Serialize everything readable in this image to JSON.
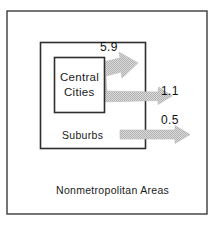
{
  "diagram": {
    "type": "migration-flow-schematic",
    "title_visible": false,
    "regions": [
      {
        "id": "central-cities",
        "label_line1": "Central",
        "label_line2": "Cities",
        "nesting_level": 2
      },
      {
        "id": "suburbs",
        "label": "Suburbs",
        "nesting_level": 1
      },
      {
        "id": "nonmetropolitan-areas",
        "label": "Nonmetropolitan Areas",
        "nesting_level": 0
      }
    ],
    "flows": [
      {
        "id": "flow-central-to-suburbs",
        "value": "5.9",
        "from": "Central Cities",
        "to": "Suburbs",
        "direction": "up-right"
      },
      {
        "id": "flow-central-to-nonmetro",
        "value": "1.1",
        "from": "Central Cities",
        "to": "Nonmetropolitan Areas",
        "direction": "right"
      },
      {
        "id": "flow-suburbs-to-nonmetro",
        "value": "0.5",
        "from": "Suburbs",
        "to": "Nonmetropolitan Areas",
        "direction": "right"
      }
    ],
    "colors": {
      "frame_stroke": "#3b3b3b",
      "box_stroke": "#2e2e2e",
      "arrow_fill": "#c9c9c9",
      "arrow_stroke": "#b8b8b8",
      "text": "#1a1a1a",
      "background": "#ffffff"
    }
  }
}
